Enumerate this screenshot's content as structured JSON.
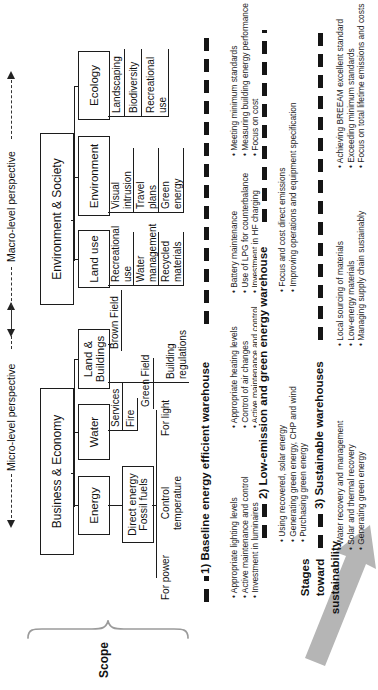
{
  "figure": {
    "perspectives": {
      "micro": "Micro-level perspective",
      "macro": "Macro-level perspective"
    },
    "scope": {
      "label": "Scope"
    },
    "stages_arrow": {
      "label_lines": [
        "Stages",
        "toward",
        "sustainability"
      ]
    },
    "tree": {
      "roots": [
        {
          "label": "Business & Economy"
        },
        {
          "label": "Environment & Society"
        }
      ],
      "level2": [
        {
          "label": "Energy"
        },
        {
          "label": "Water"
        },
        {
          "label": "Land &\nBuildings"
        },
        {
          "label": "Land use"
        },
        {
          "label": "Environment"
        },
        {
          "label": "Ecology"
        }
      ],
      "direct_energy_box": "Direct energy\nFossil fuels",
      "energy_uses": [
        "For power",
        "Control\ntemperature",
        "For light"
      ],
      "water_items": [
        "Services",
        "Fire"
      ],
      "land_items": [
        "Brown Field",
        "Green Field",
        "Building\nregulations"
      ],
      "land_use_items": [
        "Recreational\nuse",
        "Water\nmanagement",
        "Recycled\nmaterials"
      ],
      "environment_items": [
        "Visual\nintrusion",
        "Travel\nplans",
        "Green\nenergy"
      ],
      "ecology_items": [
        "Landscaping",
        "Biodiversity",
        "Recreational\nuse"
      ]
    },
    "stages": [
      {
        "heading": "1) Baseline energy efficient warehouse",
        "columns": [
          [
            "Appropriate lighting levels",
            "Active maintenance and control",
            "Investment in luminaires"
          ],
          [
            "Appropriate heating levels",
            "Control of air changes",
            "Active maintenance and control"
          ],
          [
            "Battery maintenance",
            "Use of LPG for counterbalance",
            "Investment in HF charging"
          ],
          [
            "Meeting minimum standards",
            "Measuring building energy performance",
            "Focus on cost"
          ]
        ]
      },
      {
        "heading": "2) Low-emission and green energy warehouse",
        "columns": [
          [
            "Using recovered, solar energy",
            "Generating green energy, CHP and wind",
            "Purchasing green energy"
          ],
          [
            "Focus and cost direct emissions",
            "Improving operations and equipment specification"
          ]
        ]
      },
      {
        "heading": "3) Sustainable warehouses",
        "columns": [
          [
            "Water recovery and management",
            "Solar and thermal recovery",
            "Generating green energy"
          ],
          [
            "Local sourcing of materials",
            "Low-energy materials",
            "Managing supply chain sustainably"
          ],
          [
            "Achieving BREEAM excellent standard",
            "Exceeding minimum standards",
            "Focus on total lifetime emissions and costs"
          ]
        ]
      }
    ],
    "colors": {
      "ink": "#1c1c1c",
      "arrow_gray": "#b5b5b5",
      "brace_gray": "#9b9b9b"
    }
  }
}
